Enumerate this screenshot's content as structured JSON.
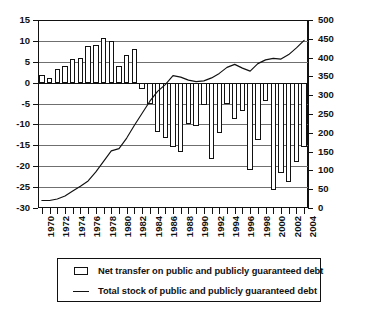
{
  "chart_data": {
    "type": "bar",
    "title": "",
    "subtitle": "",
    "xlabel": "",
    "ylabel": "",
    "grid": true,
    "legend_position": "bottom",
    "categories": [
      "1970",
      "1971",
      "1972",
      "1973",
      "1974",
      "1975",
      "1976",
      "1977",
      "1978",
      "1979",
      "1980",
      "1981",
      "1982",
      "1983",
      "1984",
      "1985",
      "1986",
      "1987",
      "1988",
      "1989",
      "1990",
      "1991",
      "1992",
      "1993",
      "1994",
      "1995",
      "1996",
      "1997",
      "1998",
      "1999",
      "2000",
      "2001",
      "2002",
      "2003",
      "2004"
    ],
    "xtick_labels": [
      "1970",
      "1972",
      "1974",
      "1976",
      "1978",
      "1980",
      "1982",
      "1984",
      "1986",
      "1988",
      "1990",
      "1992",
      "1994",
      "1996",
      "1998",
      "2000",
      "2002",
      "2004"
    ],
    "left_axis": {
      "label": "",
      "ylim": [
        -30,
        15
      ],
      "ticks": [
        15,
        10,
        5,
        0,
        -5,
        -10,
        -15,
        -20,
        -25,
        -30
      ],
      "tick_labels": [
        "15",
        "10",
        "5",
        "0",
        "-5",
        "-10",
        "-15",
        "-20",
        "-25",
        "-30"
      ]
    },
    "right_axis": {
      "label": "",
      "ylim": [
        0,
        500
      ],
      "ticks": [
        500,
        450,
        400,
        350,
        300,
        250,
        200,
        150,
        100,
        50,
        0
      ],
      "tick_labels": [
        "500",
        "450",
        "400",
        "350",
        "300",
        "250",
        "200",
        "150",
        "100",
        "50",
        "0"
      ]
    },
    "series": [
      {
        "name": "Net transfer on public and publicly guaranteed debt",
        "type": "bar",
        "axis": "left",
        "values": [
          1.8,
          1.2,
          3.3,
          4.0,
          5.7,
          5.8,
          8.8,
          9.1,
          10.8,
          9.9,
          4.1,
          6.7,
          8.1,
          -1.6,
          -5.2,
          -11.9,
          -13.2,
          -15.5,
          -16.7,
          -9.8,
          -10.3,
          -5.3,
          -18.2,
          -12.0,
          -5.2,
          -8.6,
          -6.9,
          -20.8,
          -13.8,
          -4.5,
          -25.6,
          -21.7,
          -23.8,
          -18.9,
          -15.3
        ]
      },
      {
        "name": "Total stock of public and publicly guaranteed debt",
        "type": "line",
        "axis": "right",
        "values": [
          20,
          20,
          24,
          32,
          45,
          58,
          72,
          96,
          124,
          152,
          158,
          186,
          220,
          252,
          284,
          310,
          328,
          352,
          348,
          340,
          336,
          338,
          346,
          358,
          374,
          382,
          372,
          364,
          384,
          394,
          398,
          396,
          408,
          426,
          446
        ]
      }
    ],
    "legend": [
      {
        "key": "box",
        "label": "Net transfer on public and publicly guaranteed debt"
      },
      {
        "key": "line",
        "label": "Total stock of public and publicly guaranteed debt"
      }
    ]
  }
}
